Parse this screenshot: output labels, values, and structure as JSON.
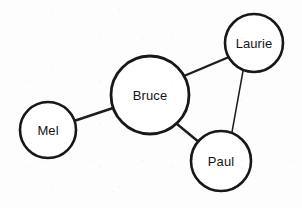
{
  "diagram": {
    "type": "node-link-graph",
    "background_color": "#fdfdfd",
    "stroke_color": "#181818",
    "node_fill": "#ffffff",
    "label_color": "#141414",
    "canvas": {
      "width": 302,
      "height": 208
    },
    "nodes": [
      {
        "id": "mel",
        "label": "Mel",
        "cx": 48,
        "cy": 130,
        "r": 28,
        "stroke_width": 2.6
      },
      {
        "id": "bruce",
        "label": "Bruce",
        "cx": 150,
        "cy": 95,
        "r": 39,
        "stroke_width": 2.8
      },
      {
        "id": "laurie",
        "label": "Laurie",
        "cx": 254,
        "cy": 43,
        "r": 29,
        "stroke_width": 2.6
      },
      {
        "id": "paul",
        "label": "Paul",
        "cx": 221,
        "cy": 161,
        "r": 30,
        "stroke_width": 2.6
      }
    ],
    "edges": [
      {
        "id": "mel-bruce",
        "source": "mel",
        "target": "bruce",
        "x1": 74,
        "y1": 121,
        "x2": 113,
        "y2": 108,
        "stroke_width": 2.4
      },
      {
        "id": "bruce-laurie",
        "source": "bruce",
        "target": "laurie",
        "x1": 184,
        "y1": 76,
        "x2": 229,
        "y2": 57,
        "stroke_width": 2.4
      },
      {
        "id": "bruce-paul",
        "source": "bruce",
        "target": "paul",
        "x1": 177,
        "y1": 124,
        "x2": 200,
        "y2": 143,
        "stroke_width": 2.4
      },
      {
        "id": "laurie-paul",
        "source": "laurie",
        "target": "paul",
        "x1": 243,
        "y1": 71,
        "x2": 232,
        "y2": 132,
        "stroke_width": 1.5
      }
    ]
  }
}
